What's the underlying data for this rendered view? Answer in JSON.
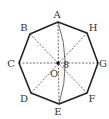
{
  "figure": {
    "type": "regular-octagon",
    "vertices": [
      {
        "label": "A",
        "x": 58,
        "y": 22,
        "lx": 57,
        "ly": 18
      },
      {
        "label": "H",
        "x": 87,
        "y": 33,
        "lx": 93,
        "ly": 31
      },
      {
        "label": "G",
        "x": 98,
        "y": 63,
        "lx": 103,
        "ly": 67
      },
      {
        "label": "F",
        "x": 87,
        "y": 93,
        "lx": 92,
        "ly": 102
      },
      {
        "label": "E",
        "x": 59,
        "y": 104,
        "lx": 58,
        "ly": 115
      },
      {
        "label": "D",
        "x": 31,
        "y": 93,
        "lx": 24,
        "ly": 102
      },
      {
        "label": "C",
        "x": 19,
        "y": 63,
        "lx": 11,
        "ly": 67
      },
      {
        "label": "B",
        "x": 30,
        "y": 34,
        "lx": 24,
        "ly": 31
      }
    ],
    "center": {
      "label": "O",
      "x": 58,
      "y": 63,
      "lx": 54,
      "ly": 77
    },
    "dashed_diagonals": [
      "AE",
      "BF",
      "CG",
      "DH"
    ],
    "arc": {
      "from": "A",
      "to": "E",
      "label": "8",
      "lx": 66,
      "ly": 68
    }
  }
}
